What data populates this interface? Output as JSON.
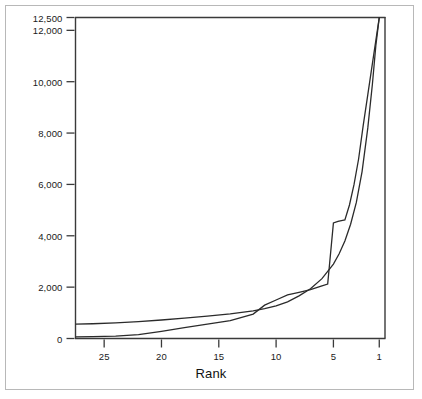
{
  "chart_data": {
    "type": "line",
    "title": "",
    "xlabel": "Rank",
    "ylabel": "",
    "xlim": [
      27.5,
      0.5
    ],
    "ylim": [
      0,
      12500
    ],
    "x_axis_reversed": true,
    "grid": false,
    "legend": false,
    "yticks": [
      0,
      2000,
      4000,
      6000,
      8000,
      10000,
      12000,
      12500
    ],
    "ytick_labels": [
      "0",
      "2,000",
      "4,000",
      "6,000",
      "8,000",
      "10,000",
      "12,000",
      "12,500"
    ],
    "xticks": [
      25,
      20,
      15,
      10,
      5,
      1
    ],
    "xtick_labels": [
      "25",
      "20",
      "15",
      "10",
      "5",
      "1"
    ],
    "series": [
      {
        "name": "curve-upper-left",
        "x": [
          27.5,
          26,
          24,
          22,
          20,
          18,
          16,
          14,
          12,
          11,
          10,
          9,
          8,
          7,
          6,
          5,
          4.5,
          4,
          3.5,
          3,
          2.5,
          2,
          1.6,
          1.3,
          1.0
        ],
        "values": [
          560,
          575,
          610,
          660,
          720,
          790,
          870,
          960,
          1080,
          1160,
          1270,
          1430,
          1660,
          1940,
          2330,
          2900,
          3300,
          3800,
          4450,
          5300,
          6500,
          8200,
          9900,
          11400,
          12500
        ]
      },
      {
        "name": "curve-lower-left",
        "x": [
          27.5,
          26,
          24,
          22,
          20,
          18,
          16,
          14,
          12,
          11,
          10,
          9,
          8,
          7,
          6,
          5.5,
          5,
          4.6,
          4.2,
          4.0,
          3.6,
          3.2,
          2.8,
          2.4,
          2.0,
          1.6,
          1.3,
          1.0
        ],
        "values": [
          60,
          70,
          95,
          150,
          280,
          420,
          560,
          700,
          950,
          1300,
          1500,
          1700,
          1800,
          1900,
          2050,
          2120,
          4500,
          4560,
          4600,
          4620,
          5200,
          6000,
          7000,
          8300,
          9500,
          10700,
          11600,
          12500
        ]
      }
    ],
    "line_color": "#2b2b2b",
    "axis_color": "#3a3a3a",
    "frame_color": "#b8b8b8",
    "background": "#ffffff"
  }
}
